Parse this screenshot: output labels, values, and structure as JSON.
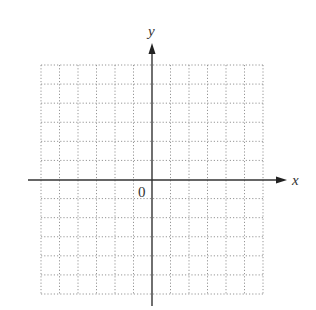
{
  "diagram": {
    "type": "coordinate-plane",
    "axes": {
      "x_label": "x",
      "y_label": "y",
      "origin_label": "0"
    },
    "grid": {
      "columns": 12,
      "rows": 12,
      "line_style": "dotted",
      "x_range": [
        -6,
        6
      ],
      "y_range": [
        -6,
        6
      ]
    },
    "colors": {
      "axis": "#333333",
      "grid": "#8a8a8a",
      "background": "#ffffff"
    }
  }
}
